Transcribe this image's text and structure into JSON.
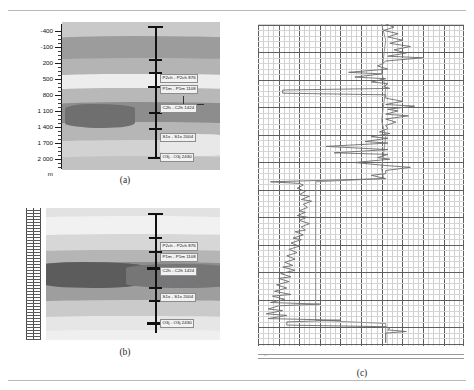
{
  "figure": {
    "panels": [
      {
        "key": "a",
        "caption": "(a)"
      },
      {
        "key": "b",
        "caption": "(b)"
      },
      {
        "key": "c",
        "caption": "(c)"
      }
    ]
  },
  "panel_a": {
    "caption": "(a)",
    "depth_axis": {
      "unit_label": "m",
      "ticks": [
        "-400",
        "-100",
        "200",
        "500",
        "800",
        "1 100",
        "1 400",
        "1 700",
        "2 000"
      ]
    },
    "horizons": [
      {
        "label": "P2ch - P2ch 876"
      },
      {
        "label": "P1m - P1m 1108"
      },
      {
        "label": "C2h - C2h 1424"
      },
      {
        "label": "S1x - S1x 2004"
      },
      {
        "label": "O3j - O3j 2430"
      }
    ]
  },
  "panel_b": {
    "caption": "(b)",
    "horizons": [
      {
        "label": "P2ch - P2ch 876"
      },
      {
        "label": "P1m - P1m 1108"
      },
      {
        "label": "C2h - C2h 1424"
      },
      {
        "label": "S1x - S1x 2004"
      },
      {
        "label": "O3j - O3j 2430"
      }
    ],
    "annotation": "C2h - C2h"
  },
  "panel_c": {
    "caption": "(c)",
    "scale_label": "m"
  },
  "chart_data": {
    "type": "line",
    "title": "",
    "xlabel": "",
    "ylabel": "",
    "grid": true,
    "legend": "none",
    "axis_orientation": "depth-vertical",
    "xlim": [
      0,
      1
    ],
    "ylim": [
      0,
      1
    ],
    "series": [
      {
        "name": "log-trace-1",
        "color": "#6b6b6b",
        "points": [
          [
            0.62,
            0.0
          ],
          [
            0.66,
            0.01
          ],
          [
            0.61,
            0.02
          ],
          [
            0.68,
            0.03
          ],
          [
            0.63,
            0.04
          ],
          [
            0.7,
            0.05
          ],
          [
            0.64,
            0.06
          ],
          [
            0.74,
            0.07
          ],
          [
            0.66,
            0.08
          ],
          [
            0.72,
            0.09
          ],
          [
            0.63,
            0.1
          ],
          [
            0.8,
            0.105
          ],
          [
            0.62,
            0.115
          ],
          [
            0.6,
            0.125
          ],
          [
            0.58,
            0.13
          ],
          [
            0.63,
            0.14
          ],
          [
            0.44,
            0.15
          ],
          [
            0.6,
            0.155
          ],
          [
            0.47,
            0.165
          ],
          [
            0.62,
            0.17
          ],
          [
            0.55,
            0.18
          ],
          [
            0.63,
            0.185
          ],
          [
            0.61,
            0.195
          ],
          [
            0.64,
            0.2
          ],
          [
            0.12,
            0.205
          ],
          [
            0.12,
            0.215
          ],
          [
            0.62,
            0.22
          ],
          [
            0.62,
            0.23
          ],
          [
            0.7,
            0.24
          ],
          [
            0.62,
            0.25
          ],
          [
            0.76,
            0.255
          ],
          [
            0.63,
            0.265
          ],
          [
            0.68,
            0.27
          ],
          [
            0.62,
            0.28
          ],
          [
            0.73,
            0.285
          ],
          [
            0.62,
            0.295
          ],
          [
            0.67,
            0.305
          ],
          [
            0.62,
            0.315
          ],
          [
            0.63,
            0.325
          ],
          [
            0.59,
            0.335
          ],
          [
            0.64,
            0.34
          ],
          [
            0.55,
            0.35
          ],
          [
            0.63,
            0.355
          ],
          [
            0.52,
            0.365
          ],
          [
            0.63,
            0.37
          ],
          [
            0.33,
            0.38
          ],
          [
            0.63,
            0.39
          ],
          [
            0.37,
            0.4
          ],
          [
            0.63,
            0.405
          ],
          [
            0.58,
            0.415
          ],
          [
            0.64,
            0.42
          ],
          [
            0.47,
            0.43
          ],
          [
            0.63,
            0.44
          ],
          [
            0.74,
            0.445
          ],
          [
            0.62,
            0.455
          ],
          [
            0.62,
            0.465
          ],
          [
            0.55,
            0.47
          ],
          [
            0.62,
            0.48
          ],
          [
            0.06,
            0.49
          ],
          [
            0.2,
            0.495
          ],
          [
            0.22,
            0.5
          ],
          [
            0.19,
            0.51
          ],
          [
            0.23,
            0.52
          ],
          [
            0.2,
            0.53
          ],
          [
            0.25,
            0.535
          ],
          [
            0.21,
            0.545
          ],
          [
            0.26,
            0.55
          ],
          [
            0.22,
            0.56
          ],
          [
            0.24,
            0.57
          ],
          [
            0.2,
            0.58
          ],
          [
            0.23,
            0.585
          ],
          [
            0.19,
            0.595
          ],
          [
            0.24,
            0.6
          ],
          [
            0.2,
            0.61
          ],
          [
            0.25,
            0.62
          ],
          [
            0.21,
            0.63
          ],
          [
            0.23,
            0.64
          ],
          [
            0.18,
            0.645
          ],
          [
            0.22,
            0.655
          ],
          [
            0.17,
            0.665
          ],
          [
            0.21,
            0.67
          ],
          [
            0.16,
            0.68
          ],
          [
            0.2,
            0.69
          ],
          [
            0.15,
            0.7
          ],
          [
            0.19,
            0.71
          ],
          [
            0.14,
            0.72
          ],
          [
            0.18,
            0.73
          ],
          [
            0.13,
            0.74
          ],
          [
            0.17,
            0.75
          ],
          [
            0.12,
            0.755
          ],
          [
            0.18,
            0.765
          ],
          [
            0.11,
            0.775
          ],
          [
            0.16,
            0.785
          ],
          [
            0.1,
            0.79
          ],
          [
            0.15,
            0.8
          ],
          [
            0.09,
            0.81
          ],
          [
            0.14,
            0.82
          ],
          [
            0.08,
            0.83
          ],
          [
            0.16,
            0.84
          ],
          [
            0.07,
            0.845
          ],
          [
            0.13,
            0.855
          ],
          [
            0.06,
            0.865
          ],
          [
            0.3,
            0.87
          ],
          [
            0.1,
            0.875
          ],
          [
            0.05,
            0.885
          ],
          [
            0.12,
            0.89
          ],
          [
            0.04,
            0.9
          ],
          [
            0.14,
            0.905
          ],
          [
            0.05,
            0.915
          ],
          [
            0.4,
            0.92
          ],
          [
            0.14,
            0.925
          ],
          [
            0.14,
            0.935
          ],
          [
            0.62,
            0.94
          ],
          [
            0.64,
            0.945
          ],
          [
            0.63,
            0.95
          ],
          [
            0.72,
            0.955
          ],
          [
            0.62,
            0.96
          ],
          [
            0.62,
            0.99
          ]
        ]
      },
      {
        "name": "log-trace-2",
        "color": "#8a8a8a",
        "points": [
          [
            0.6,
            0.0
          ],
          [
            0.62,
            0.05
          ],
          [
            0.61,
            0.1
          ],
          [
            0.6,
            0.15
          ],
          [
            0.62,
            0.2
          ],
          [
            0.61,
            0.25
          ],
          [
            0.6,
            0.3
          ],
          [
            0.62,
            0.35
          ],
          [
            0.61,
            0.4
          ],
          [
            0.6,
            0.45
          ],
          [
            0.61,
            0.48
          ],
          [
            0.28,
            0.49
          ],
          [
            0.28,
            0.6
          ],
          [
            0.28,
            0.7
          ],
          [
            0.28,
            0.8
          ],
          [
            0.28,
            0.88
          ],
          [
            0.28,
            0.92
          ],
          [
            0.62,
            0.93
          ],
          [
            0.62,
            0.99
          ]
        ]
      }
    ]
  },
  "strata_a": [
    {
      "tone": "#c9c9c9"
    },
    {
      "tone": "#9a9a9a"
    },
    {
      "tone": "#ededed"
    },
    {
      "tone": "#b2b2b2"
    },
    {
      "tone": "#7e7e7e"
    },
    {
      "tone": "#c0c0c0"
    },
    {
      "tone": "#e4e4e4"
    },
    {
      "tone": "#cfcfcf"
    }
  ],
  "strata_b": [
    {
      "tone": "#e6e6e6"
    },
    {
      "tone": "#f0f0f0"
    },
    {
      "tone": "#b9b9b9"
    },
    {
      "tone": "#9e9e9e"
    },
    {
      "tone": "#5f5f5f"
    },
    {
      "tone": "#8f8f8f"
    },
    {
      "tone": "#d3d3d3"
    },
    {
      "tone": "#ededed"
    }
  ]
}
